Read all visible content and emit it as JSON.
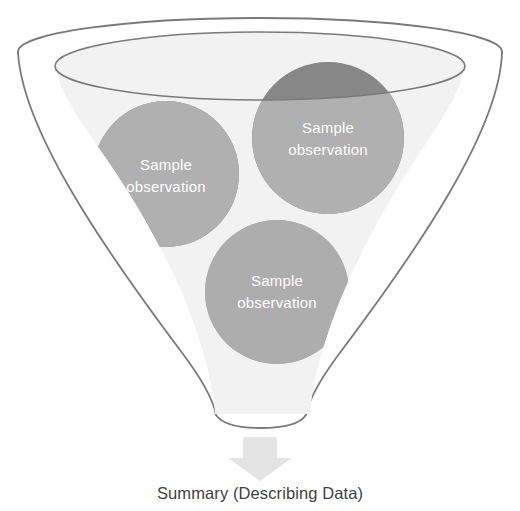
{
  "diagram": {
    "title_caption": "Summary (Describing Data)",
    "funnel": {
      "name": "funnel",
      "outline_color": "#7a7a7a",
      "interior_fill": "#f2f2f2",
      "body_fill": "#ffffff"
    },
    "arrow": {
      "name": "down-arrow",
      "fill": "#e4e4e4",
      "direction": "down"
    },
    "observations": [
      {
        "id": "left",
        "line1": "Sample",
        "line2": "observation",
        "fill": "#878787",
        "submerged_fill": "#b0b0b0",
        "cx": 166,
        "cy": 174,
        "r": 73
      },
      {
        "id": "right",
        "line1": "Sample",
        "line2": "observation",
        "fill": "#878787",
        "submerged_fill": "#b0b0b0",
        "cx": 328,
        "cy": 138,
        "r": 76
      },
      {
        "id": "bottom",
        "line1": "Sample",
        "line2": "observation",
        "fill": "#adadad",
        "submerged_fill": "#adadad",
        "cx": 277,
        "cy": 292,
        "r": 72
      }
    ]
  }
}
